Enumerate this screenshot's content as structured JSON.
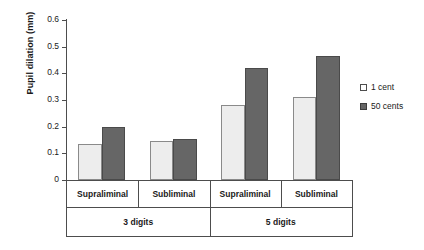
{
  "chart_data": {
    "type": "bar",
    "title": "",
    "xlabel": "",
    "ylabel": "Pupil dilation (mm)",
    "ylim": [
      0,
      0.6
    ],
    "ytick_labels": [
      "0.6",
      "0.5",
      "0.4",
      "0.3",
      "0.2",
      "0.1",
      "0"
    ],
    "ytick_values": [
      0.6,
      0.5,
      0.4,
      0.3,
      0.2,
      0.1,
      0
    ],
    "grid": false,
    "legend_position": "right",
    "categories": [
      "Supraliminal",
      "Subliminal",
      "Supraliminal",
      "Subliminal"
    ],
    "groups": [
      {
        "label": "3 digits",
        "categories": [
          "Supraliminal",
          "Subliminal"
        ]
      },
      {
        "label": "5 digits",
        "categories": [
          "Supraliminal",
          "Subliminal"
        ]
      }
    ],
    "series": [
      {
        "name": "1 cent",
        "color": "#ededed",
        "values": [
          0.135,
          0.148,
          0.28,
          0.31
        ]
      },
      {
        "name": "50 cents",
        "color": "#666666",
        "values": [
          0.2,
          0.155,
          0.42,
          0.465
        ]
      }
    ]
  },
  "legend": {
    "items": [
      {
        "label": "1 cent"
      },
      {
        "label": "50 cents"
      }
    ]
  },
  "axis": {
    "y_title": "Pupil dilation (mm)"
  }
}
